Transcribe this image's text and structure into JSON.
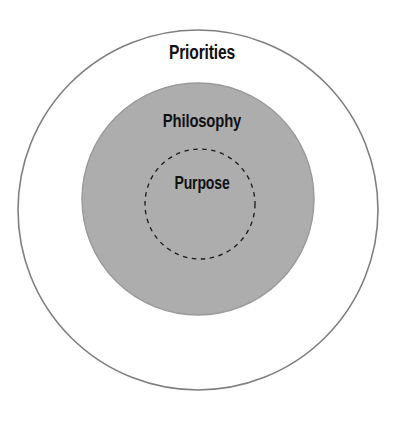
{
  "diagram": {
    "type": "concentric-circles",
    "title": "",
    "background_color": "#ffffff",
    "rings": [
      {
        "id": "priorities",
        "label": "Priorities",
        "level": 1,
        "fill_color": "#ffffff",
        "stroke_color": "#7f7f7f",
        "stroke_style": "solid",
        "center_x": 198,
        "center_y": 210,
        "radius": 180
      },
      {
        "id": "philosophy",
        "label": "Philosophy",
        "level": 2,
        "fill_color": "#adadad",
        "stroke_color": "#9a9a9a",
        "stroke_style": "solid",
        "center_x": 198,
        "center_y": 199,
        "radius": 116
      },
      {
        "id": "purpose",
        "label": "Purpose",
        "level": 3,
        "fill_color": "none",
        "stroke_color": "#1a1a1a",
        "stroke_style": "dashed",
        "center_x": 200,
        "center_y": 204,
        "radius": 55
      }
    ]
  }
}
